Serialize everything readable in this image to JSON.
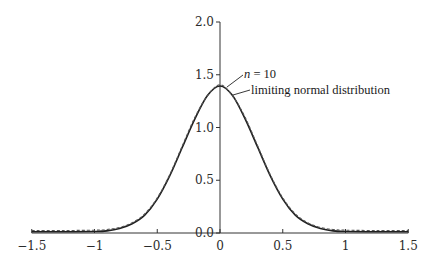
{
  "chart_data": {
    "type": "line",
    "title": "",
    "xlabel": "",
    "ylabel": "",
    "xlim": [
      -1.5,
      1.5
    ],
    "ylim": [
      0.0,
      2.0
    ],
    "grid": false,
    "legend": "none (inline annotations with leader lines near the peak)",
    "x_ticks": [
      -1.5,
      -1,
      -0.5,
      0,
      0.5,
      1,
      1.5
    ],
    "x_tick_labels": [
      "−1.5",
      "−1",
      "−0.5",
      "0",
      "0.5",
      "1",
      "1.5"
    ],
    "y_ticks": [
      0.0,
      0.5,
      1.0,
      1.5,
      2.0
    ],
    "y_tick_labels": [
      "0.0",
      "0.5",
      "1.0",
      "1.5",
      "2.0"
    ],
    "y_axis_position": "x = 0",
    "series": [
      {
        "name": "n = 10",
        "style": "solid",
        "x": [
          -1.5,
          -1.25,
          -1.0,
          -0.9,
          -0.8,
          -0.7,
          -0.6,
          -0.5,
          -0.4,
          -0.3,
          -0.2,
          -0.1,
          0.0,
          0.1,
          0.2,
          0.3,
          0.4,
          0.5,
          0.6,
          0.7,
          0.8,
          0.9,
          1.0,
          1.25,
          1.5
        ],
        "values": [
          0.0,
          0.0,
          0.003,
          0.009,
          0.031,
          0.076,
          0.158,
          0.31,
          0.532,
          0.802,
          1.07,
          1.291,
          1.382,
          1.291,
          1.07,
          0.802,
          0.532,
          0.31,
          0.158,
          0.076,
          0.031,
          0.009,
          0.003,
          0.0,
          0.0
        ]
      },
      {
        "name": "limiting normal distribution",
        "style": "dashed",
        "mean": 0,
        "variance": 0.0833,
        "x": [
          -1.5,
          -1.25,
          -1.0,
          -0.9,
          -0.8,
          -0.7,
          -0.6,
          -0.5,
          -0.4,
          -0.3,
          -0.2,
          -0.1,
          0.0,
          0.1,
          0.2,
          0.3,
          0.4,
          0.5,
          0.6,
          0.7,
          0.8,
          0.9,
          1.0,
          1.25,
          1.5
        ],
        "values": [
          0.0,
          0.0,
          0.003,
          0.01,
          0.029,
          0.073,
          0.158,
          0.309,
          0.53,
          0.803,
          1.073,
          1.276,
          1.382,
          1.276,
          1.073,
          0.803,
          0.53,
          0.309,
          0.158,
          0.073,
          0.029,
          0.01,
          0.003,
          0.0,
          0.0
        ]
      }
    ],
    "annotations": [
      {
        "text_var": "n",
        "text_rest": " = 10",
        "points_to": "n = 10 curve near peak"
      },
      {
        "text": "limiting normal distribution",
        "points_to": "dashed curve near peak"
      }
    ]
  },
  "labels": {
    "annot_n_var": "n",
    "annot_n_rest": " = 10",
    "annot_normal": "limiting normal distribution"
  }
}
